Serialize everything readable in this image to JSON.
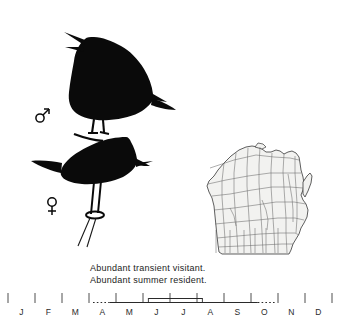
{
  "plate": {
    "title": "bird-silhouette-plate",
    "birds": [
      {
        "id": "male-bird",
        "symbol": "♂",
        "pose": "singing, perched on branch"
      },
      {
        "id": "female-bird",
        "symbol": "♀",
        "pose": "perched on branch"
      }
    ],
    "symbols": {
      "male": "♂",
      "female": "♀"
    },
    "ink_color": "#0a0a0a"
  },
  "map": {
    "title": "wisconsin-county-map",
    "state": "Wisconsin",
    "fill": "#f2f2f0",
    "stroke": "#5a5a5a"
  },
  "caption": {
    "line1": "Abundant transient visitant.",
    "line2": "Abundant summer resident."
  },
  "chart_data": {
    "type": "timeline",
    "categories": [
      "J",
      "F",
      "M",
      "A",
      "M",
      "J",
      "J",
      "A",
      "S",
      "O",
      "N",
      "D"
    ],
    "month_names": [
      "January",
      "February",
      "March",
      "April",
      "May",
      "June",
      "July",
      "August",
      "September",
      "October",
      "November",
      "December"
    ],
    "xlabel": "",
    "ylabel": "",
    "axis_range": [
      0,
      12
    ],
    "grid": false,
    "series": [
      {
        "name": "Abundant transient visitant.",
        "row": 1,
        "segments": [
          {
            "style": "dashed",
            "start": 3.15,
            "end": 3.75
          },
          {
            "style": "solid",
            "start": 3.75,
            "end": 9.25
          },
          {
            "style": "dashed",
            "start": 9.25,
            "end": 9.95
          }
        ]
      },
      {
        "name": "Abundant summer resident.",
        "row": 0,
        "segments": [
          {
            "style": "solid",
            "start": 5.2,
            "end": 7.2
          }
        ]
      }
    ],
    "tick_months": [
      "J",
      "F",
      "M",
      "A",
      "M",
      "J",
      "J",
      "A",
      "S",
      "O",
      "N",
      "D"
    ]
  }
}
